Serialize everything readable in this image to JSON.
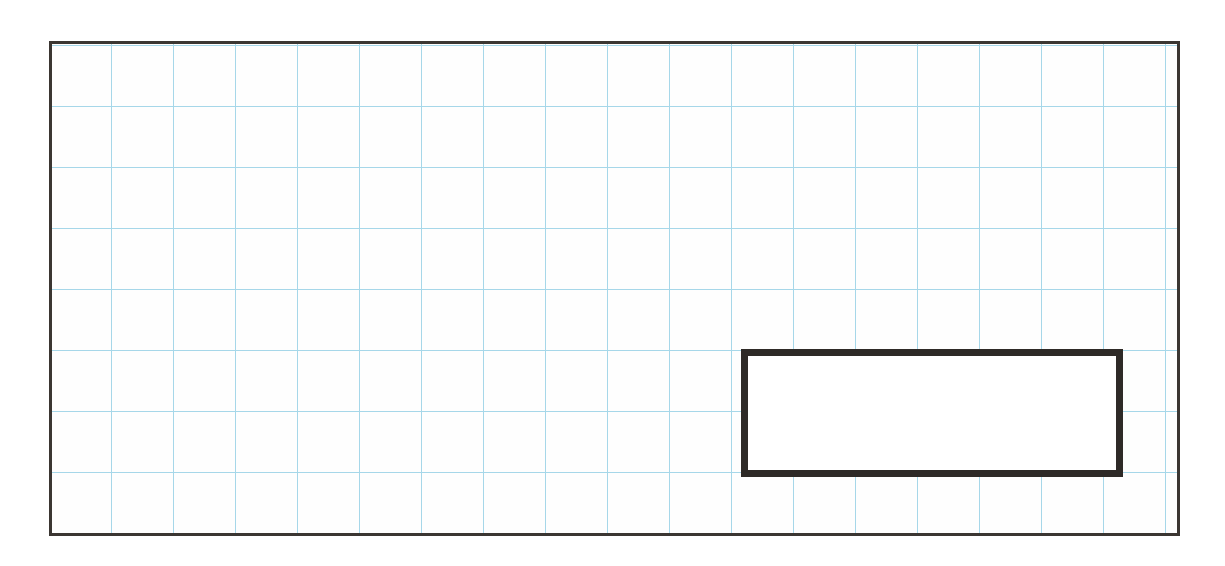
{
  "figure": {
    "text_content_visible": "none"
  },
  "colors": {
    "page_background": "#ffffff",
    "paper_background": "#fefefe",
    "grid_line": "#a6d7e9",
    "outer_border": "#3b3632",
    "inner_border": "#2e2a27",
    "inner_fill": "#ffffff"
  },
  "grid": {
    "cell_width_px": 62,
    "cell_height_px": 61,
    "offset_x_px": -3,
    "offset_y_px": 1,
    "columns_visible": 18,
    "rows_visible": 8
  },
  "outer_rectangle": {
    "left_px": 49,
    "top_px": 41,
    "width_px": 1131,
    "height_px": 495,
    "border_px": 3
  },
  "inner_rectangle": {
    "left_px": 689,
    "top_px": 305,
    "width_px": 382,
    "height_px": 128,
    "border_px": 7,
    "width_in_cells": 6,
    "height_in_cells": 2
  }
}
